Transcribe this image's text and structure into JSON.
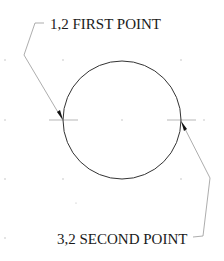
{
  "diagram": {
    "type": "cad-circle-two-point",
    "labels": {
      "first_point": "1,2 FIRST POINT",
      "second_point": "3,2 SECOND POINT"
    },
    "circle": {
      "center": [
        122,
        120
      ],
      "radius": 59
    },
    "points": [
      {
        "id": "first",
        "x": 63,
        "y": 120
      },
      {
        "id": "second",
        "x": 181,
        "y": 120
      }
    ],
    "grid": {
      "x": [
        5,
        63,
        122,
        181
      ],
      "y": [
        60,
        120,
        179,
        238
      ]
    },
    "colors": {
      "line": "#333333",
      "leader": "#8a8a8a",
      "grid_dot": "#b5b5b5",
      "crosshair": "#9a9a9a",
      "arrow": "#111111",
      "text": "#1a1a1a"
    }
  }
}
